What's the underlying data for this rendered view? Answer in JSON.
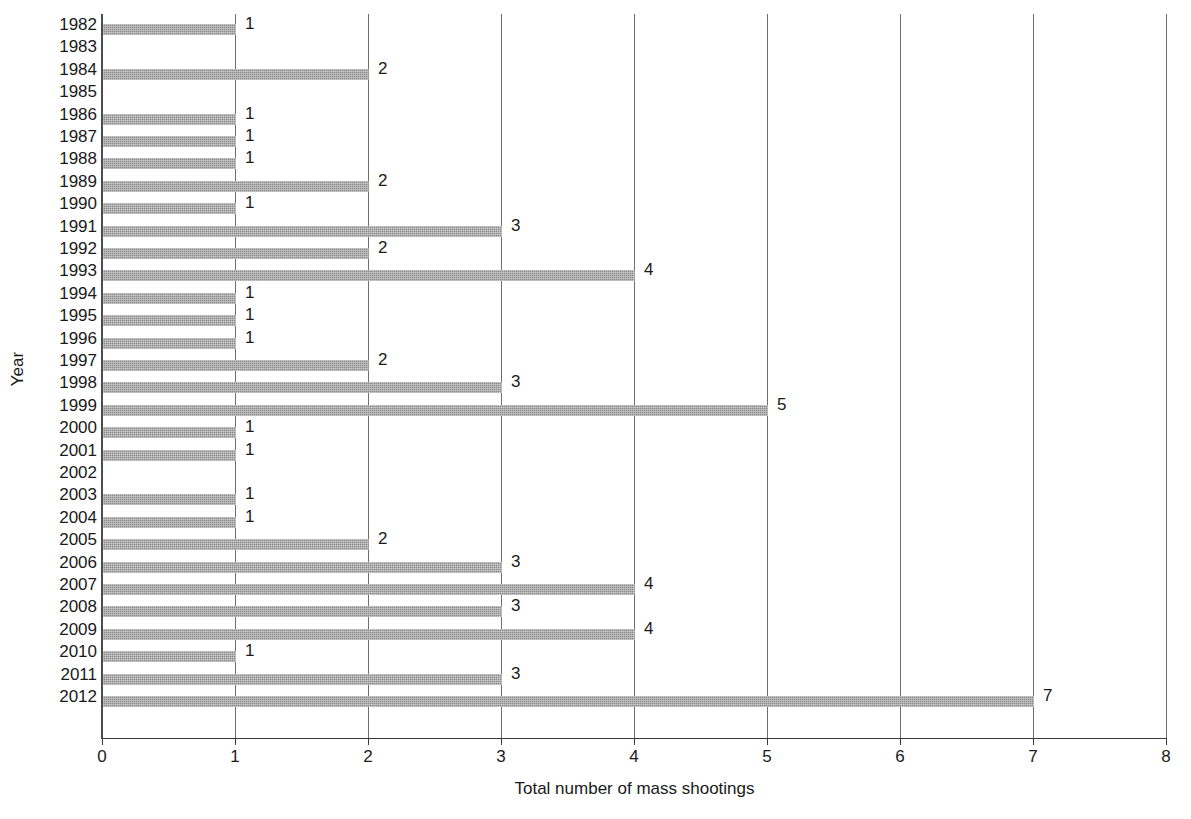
{
  "chart_data": {
    "type": "bar",
    "orientation": "horizontal",
    "title": "",
    "xlabel": "Total number of mass shootings",
    "ylabel": "Year",
    "xlim": [
      0,
      8
    ],
    "xticks": [
      "0",
      "1",
      "2",
      "3",
      "4",
      "5",
      "6",
      "7",
      "8"
    ],
    "grid": "vertical",
    "legend": "none",
    "bar_color": "#8c8c8c",
    "data_labels": true,
    "categories": [
      "1982",
      "1983",
      "1984",
      "1985",
      "1986",
      "1987",
      "1988",
      "1989",
      "1990",
      "1991",
      "1992",
      "1993",
      "1994",
      "1995",
      "1996",
      "1997",
      "1998",
      "1999",
      "2000",
      "2001",
      "2002",
      "2003",
      "2004",
      "2005",
      "2006",
      "2007",
      "2008",
      "2009",
      "2010",
      "2011",
      "2012"
    ],
    "values": [
      1,
      0,
      2,
      0,
      1,
      1,
      1,
      2,
      1,
      3,
      2,
      4,
      1,
      1,
      1,
      2,
      3,
      5,
      1,
      1,
      0,
      1,
      1,
      2,
      3,
      4,
      3,
      4,
      1,
      3,
      7
    ],
    "value_labels": [
      "1",
      "",
      "2",
      "",
      "1",
      "1",
      "1",
      "2",
      "1",
      "3",
      "2",
      "4",
      "1",
      "1",
      "1",
      "2",
      "3",
      "5",
      "1",
      "1",
      "",
      "1",
      "1",
      "2",
      "3",
      "4",
      "3",
      "4",
      "1",
      "3",
      "7"
    ]
  }
}
